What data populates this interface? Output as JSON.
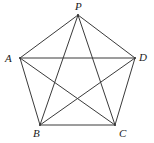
{
  "figure": {
    "type": "geometry-diagram",
    "background_color": "#ffffff",
    "stroke_color": "#3a3a3a",
    "stroke_width": 1,
    "label_color": "#1a1a1a",
    "canvas": {
      "width": 154,
      "height": 143
    }
  },
  "vertices": [
    {
      "id": "P",
      "label": "P",
      "x": 78,
      "y": 15,
      "label_x": 75,
      "label_y": 1,
      "position": "top"
    },
    {
      "id": "A",
      "label": "A",
      "x": 20,
      "y": 58,
      "label_x": 5,
      "label_y": 53,
      "position": "left"
    },
    {
      "id": "D",
      "label": "D",
      "x": 135,
      "y": 58,
      "label_x": 139,
      "label_y": 52,
      "position": "right"
    },
    {
      "id": "B",
      "label": "B",
      "x": 40,
      "y": 125,
      "label_x": 33,
      "label_y": 128,
      "position": "bottom-left"
    },
    {
      "id": "C",
      "label": "C",
      "x": 115,
      "y": 125,
      "label_x": 119,
      "label_y": 128,
      "position": "bottom-right"
    }
  ],
  "edges": [
    {
      "from": "P",
      "to": "A",
      "kind": "side"
    },
    {
      "from": "A",
      "to": "B",
      "kind": "side"
    },
    {
      "from": "B",
      "to": "C",
      "kind": "side"
    },
    {
      "from": "C",
      "to": "D",
      "kind": "side"
    },
    {
      "from": "D",
      "to": "P",
      "kind": "side"
    },
    {
      "from": "P",
      "to": "B",
      "kind": "diagonal"
    },
    {
      "from": "P",
      "to": "C",
      "kind": "diagonal"
    },
    {
      "from": "A",
      "to": "C",
      "kind": "diagonal"
    },
    {
      "from": "A",
      "to": "D",
      "kind": "diagonal"
    },
    {
      "from": "B",
      "to": "D",
      "kind": "diagonal"
    }
  ]
}
